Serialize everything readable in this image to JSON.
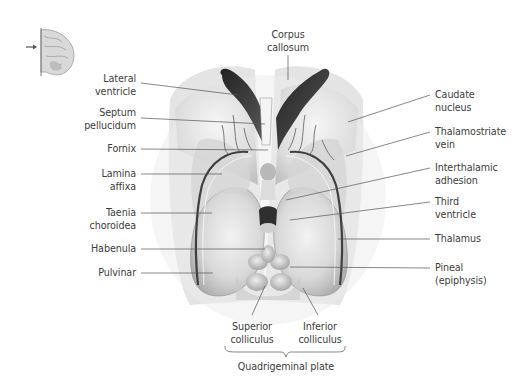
{
  "figure": {
    "orientation_icon": "brain-sagittal-orientation-icon"
  },
  "labels_left": [
    {
      "id": "lateral-ventricle",
      "line1": "Lateral",
      "line2": "ventricle"
    },
    {
      "id": "septum-pellucidum",
      "line1": "Septum",
      "line2": "pellucidum"
    },
    {
      "id": "fornix",
      "line1": "Fornix",
      "line2": ""
    },
    {
      "id": "lamina-affixa",
      "line1": "Lamina",
      "line2": "affixa"
    },
    {
      "id": "taenia-choroidea",
      "line1": "Taenia",
      "line2": "choroidea"
    },
    {
      "id": "habenula",
      "line1": "Habenula",
      "line2": ""
    },
    {
      "id": "pulvinar",
      "line1": "Pulvinar",
      "line2": ""
    }
  ],
  "labels_right": [
    {
      "id": "caudate-nucleus",
      "line1": "Caudate",
      "line2": "nucleus"
    },
    {
      "id": "thalamostriate-vein",
      "line1": "Thalamostriate",
      "line2": "vein"
    },
    {
      "id": "interthalamic-adhesion",
      "line1": "Interthalamic",
      "line2": "adhesion"
    },
    {
      "id": "third-ventricle",
      "line1": "Third",
      "line2": "ventricle"
    },
    {
      "id": "thalamus",
      "line1": "Thalamus",
      "line2": ""
    },
    {
      "id": "pineal",
      "line1": "Pineal",
      "line2": "(epiphysis)"
    }
  ],
  "labels_top": [
    {
      "id": "corpus-callosum",
      "line1": "Corpus",
      "line2": "callosum"
    }
  ],
  "labels_bottom": [
    {
      "id": "superior-colliculus",
      "line1": "Superior",
      "line2": "colliculus"
    },
    {
      "id": "inferior-colliculus",
      "line1": "Inferior",
      "line2": "colliculus"
    }
  ],
  "group_label": {
    "id": "quadrigeminal-plate",
    "text": "Quadrigeminal plate"
  },
  "colors": {
    "ventricle_dark": "#3a3a3a",
    "tissue_light": "#e6e6e6",
    "tissue_mid": "#bdbdbd",
    "leader_line": "#555555",
    "text": "#3d3d3d"
  }
}
